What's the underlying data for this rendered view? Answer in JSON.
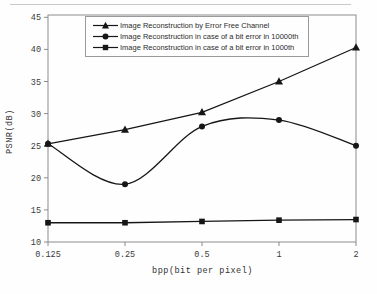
{
  "chart_data": {
    "type": "line",
    "title": "",
    "xlabel": "bpp(bit per pixel)",
    "ylabel": "PSNR(dB)",
    "x_categories": [
      "0.125",
      "0.25",
      "0.5",
      "1",
      "2"
    ],
    "y_ticks": [
      10,
      15,
      20,
      25,
      30,
      35,
      40,
      45
    ],
    "ylim": [
      10,
      45
    ],
    "grid": false,
    "legend_position": "top-inside-border-box",
    "line_color": "#161616",
    "frame_color": "#8c8c8c",
    "series": [
      {
        "name": "Image Reconstruction by Error Free Channel",
        "marker": "triangle",
        "smooth": false,
        "values": [
          25.3,
          27.5,
          30.2,
          35.0,
          40.3
        ]
      },
      {
        "name": "Image Reconstruction in case of a bit error in 10000th",
        "marker": "circle",
        "smooth": true,
        "values": [
          25.3,
          19.0,
          28.0,
          29.0,
          25.0
        ]
      },
      {
        "name": "Image Reconstruction in case of a bit error in 1000th",
        "marker": "square",
        "smooth": false,
        "values": [
          13.0,
          13.0,
          13.2,
          13.4,
          13.5
        ]
      }
    ]
  }
}
